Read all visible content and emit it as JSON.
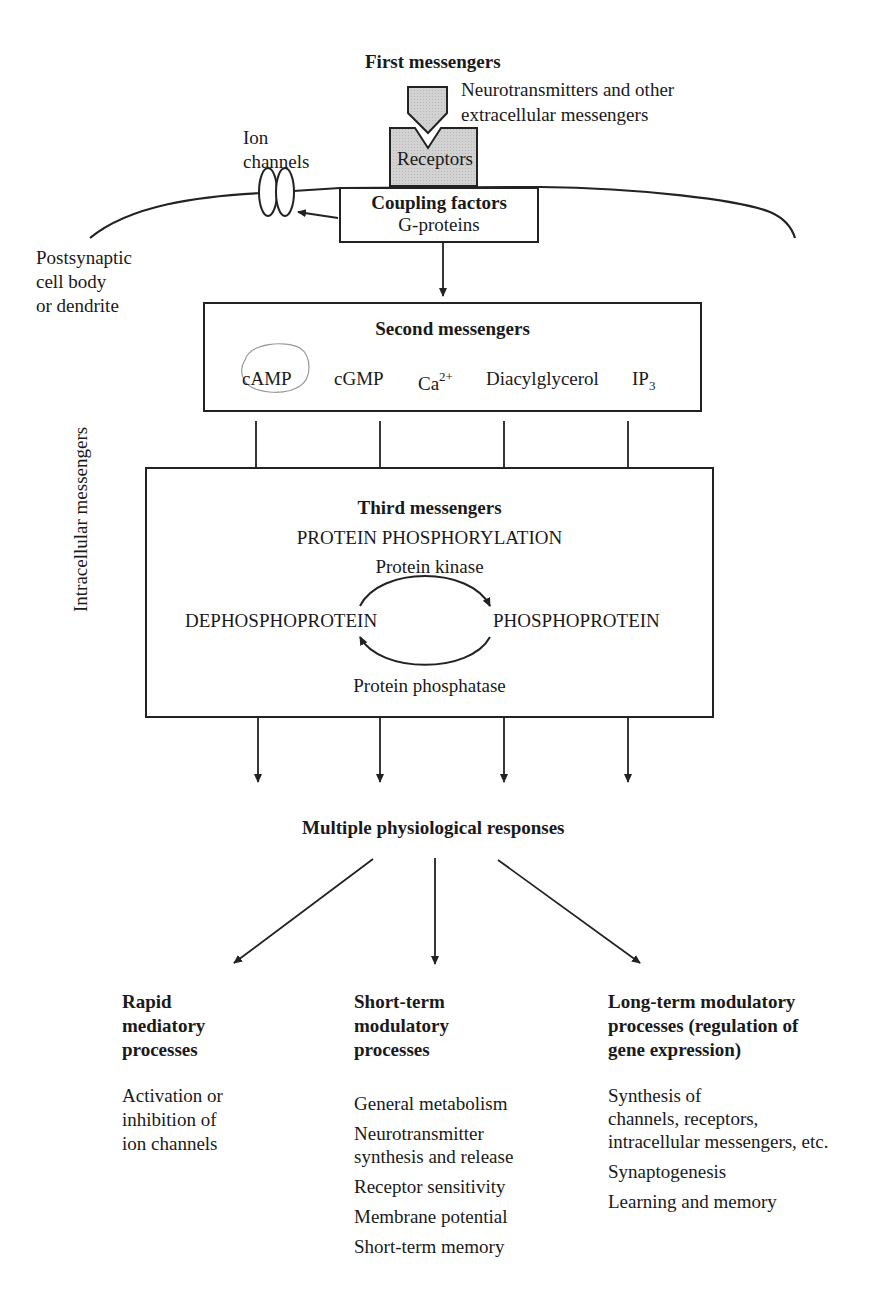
{
  "first_messengers": {
    "title": "First messengers",
    "ligand_label_line1": "Neurotransmitters and other",
    "ligand_label_line2": "extracellular messengers",
    "receptor_label": "Receptors"
  },
  "ion_channels": {
    "line1": "Ion",
    "line2": "channels"
  },
  "coupling": {
    "title": "Coupling factors",
    "subtitle": "G-proteins"
  },
  "cell_label": {
    "line1": "Postsynaptic",
    "line2": "cell body",
    "line3": "or dendrite"
  },
  "side_label": "Intracellular messengers",
  "second_messengers": {
    "title": "Second messengers",
    "items": [
      {
        "name": "cAMP",
        "sup": "",
        "sub": ""
      },
      {
        "name": "cGMP",
        "sup": "",
        "sub": ""
      },
      {
        "name": "Ca",
        "sup": "2+",
        "sub": ""
      },
      {
        "name": "Diacylglycerol",
        "sup": "",
        "sub": ""
      },
      {
        "name": "IP",
        "sup": "",
        "sub": "3"
      }
    ]
  },
  "third_messengers": {
    "title": "Third messengers",
    "subtitle": "PROTEIN PHOSPHORYLATION",
    "kinase": "Protein kinase",
    "phosphatase": "Protein phosphatase",
    "left_state": "DEPHOSPHOPROTEIN",
    "right_state": "PHOSPHOPROTEIN"
  },
  "responses": {
    "title": "Multiple physiological responses"
  },
  "outcomes": [
    {
      "title_lines": [
        "Rapid",
        "mediatory",
        "processes"
      ],
      "items": [
        "Activation or",
        "inhibition of",
        "ion channels"
      ]
    },
    {
      "title_lines": [
        "Short-term",
        "modulatory",
        "processes"
      ],
      "items": [
        "General metabolism",
        "Neurotransmitter\nsynthesis and release",
        "Receptor sensitivity",
        "Membrane potential",
        "Short-term memory"
      ]
    },
    {
      "title_lines": [
        "Long-term modulatory",
        "processes (regulation of",
        "gene expression)"
      ],
      "items": [
        "Synthesis of\nchannels, receptors,\nintracellular messengers, etc.",
        "Synaptogenesis",
        "Learning and memory"
      ]
    }
  ]
}
